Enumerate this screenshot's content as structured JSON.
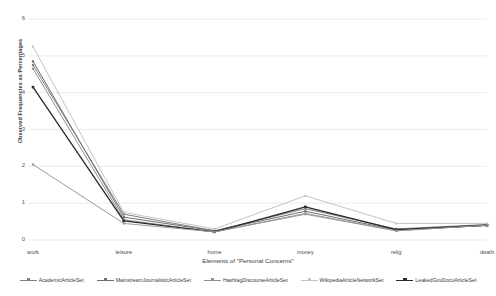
{
  "chart_data": {
    "type": "line",
    "title": "",
    "xlabel": "Elements of \"Personal Concerns\"",
    "ylabel": "Observed Frequencies as Percentages",
    "categories": [
      "work",
      "leisure",
      "home",
      "money",
      "relig",
      "death"
    ],
    "ylim": [
      0,
      6
    ],
    "yticks": [
      0,
      1,
      2,
      3,
      4,
      5,
      6
    ],
    "ytick_labels": [
      "0",
      "1",
      "2",
      "3",
      "4",
      "5",
      "6"
    ],
    "grid": true,
    "legend_position": "bottom",
    "series": [
      {
        "name": "AcademicArticleSet",
        "color": "#808080",
        "marker": "square",
        "values": [
          4.75,
          0.7,
          0.25,
          0.85,
          0.3,
          0.42
        ]
      },
      {
        "name": "MainstreamJournalisticArticleSet",
        "color": "#6e6e6e",
        "marker": "square",
        "values": [
          4.85,
          0.62,
          0.25,
          0.78,
          0.27,
          0.4
        ]
      },
      {
        "name": "HashtagDiscourseArticleSet",
        "color": "#909090",
        "marker": "square",
        "values": [
          4.65,
          0.55,
          0.22,
          0.72,
          0.25,
          0.4
        ]
      },
      {
        "name": "WikipediaArticleNetworkSet",
        "color": "#c4c4c4",
        "marker": "square",
        "values": [
          5.25,
          0.75,
          0.3,
          1.2,
          0.45,
          0.45
        ]
      },
      {
        "name": "LeakedGovDocuArticleSet",
        "color": "#2b2b2b",
        "marker": "square",
        "values": [
          4.15,
          0.52,
          0.22,
          0.9,
          0.28,
          0.4
        ]
      },
      {
        "name": "",
        "color": "#9a9a9a",
        "marker": "square",
        "legend_hidden": true,
        "values": [
          2.05,
          0.45,
          0.22,
          0.7,
          0.25,
          0.4
        ]
      }
    ]
  },
  "axes": {
    "ylabel": "Observed Frequencies as Percentages",
    "xlabel": "Elements of \"Personal Concerns\""
  }
}
